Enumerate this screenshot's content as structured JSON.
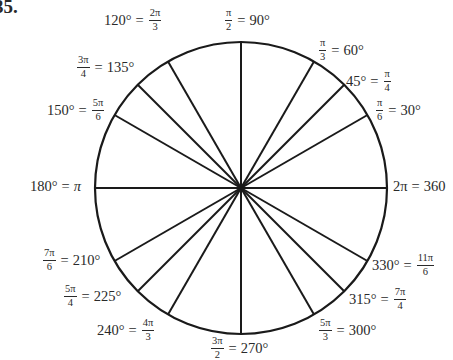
{
  "problem_number": "35.",
  "circle": {
    "cx": 241,
    "cy": 188,
    "r": 146,
    "stroke": "#1a1a1a"
  },
  "chart_data": {
    "type": "diagram",
    "angles": [
      {
        "deg": 0,
        "label": "2π = 360°"
      },
      {
        "deg": 30,
        "label": "π/6 = 30°"
      },
      {
        "deg": 45,
        "label": "45° = π/4"
      },
      {
        "deg": 60,
        "label": "π/3 = 60°"
      },
      {
        "deg": 90,
        "label": "π/2 = 90°"
      },
      {
        "deg": 120,
        "label": "120° = 2π/3"
      },
      {
        "deg": 135,
        "label": "3π/4 = 135°"
      },
      {
        "deg": 150,
        "label": "150° = 5π/6"
      },
      {
        "deg": 180,
        "label": "180° = π"
      },
      {
        "deg": 210,
        "label": "7π/6 = 210°"
      },
      {
        "deg": 225,
        "label": "5π/4 = 225°"
      },
      {
        "deg": 240,
        "label": "240° = 4π/3"
      },
      {
        "deg": 270,
        "label": "3π/2 = 270°"
      },
      {
        "deg": 300,
        "label": "5π/3 = 300°"
      },
      {
        "deg": 315,
        "label": "315° = 7π/4"
      },
      {
        "deg": 330,
        "label": "330° = 11π/6"
      }
    ]
  },
  "labels": {
    "a90": {
      "num": "π",
      "den": "2",
      "deg": "90°"
    },
    "a60": {
      "num": "π",
      "den": "3",
      "deg": "60°"
    },
    "a45": {
      "num": "π",
      "den": "4",
      "deg": "45°"
    },
    "a30": {
      "num": "π",
      "den": "6",
      "deg": "30°"
    },
    "a0": {
      "rad": "2π",
      "deg": "360"
    },
    "a120": {
      "num": "2π",
      "den": "3",
      "deg": "120°"
    },
    "a135": {
      "num": "3π",
      "den": "4",
      "deg": "135°"
    },
    "a150": {
      "num": "5π",
      "den": "6",
      "deg": "150°"
    },
    "a180": {
      "rad": "π",
      "deg": "180°"
    },
    "a210": {
      "num": "7π",
      "den": "6",
      "deg": "210°"
    },
    "a225": {
      "num": "5π",
      "den": "4",
      "deg": "225°"
    },
    "a240": {
      "num": "4π",
      "den": "3",
      "deg": "240°"
    },
    "a270": {
      "num": "3π",
      "den": "2",
      "deg": "270°"
    },
    "a300": {
      "num": "5π",
      "den": "3",
      "deg": "300°"
    },
    "a315": {
      "num": "7π",
      "den": "4",
      "deg": "315°"
    },
    "a330": {
      "num": "11π",
      "den": "6",
      "deg": "330°"
    },
    "eq": "="
  }
}
